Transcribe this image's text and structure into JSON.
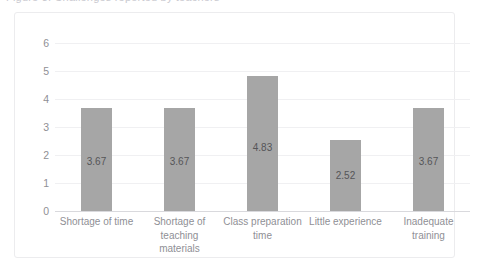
{
  "clipped_title": "Figure 3. Challenges reported by teachers",
  "chart_data": {
    "type": "bar",
    "title": "",
    "xlabel": "",
    "ylabel": "",
    "categories": [
      "Shortage of time",
      "Shortage of teaching materials",
      "Class preparation time",
      "Little experience",
      "Inadequate training"
    ],
    "category_lines": [
      [
        "Shortage of time"
      ],
      [
        "Shortage of",
        "teaching",
        "materials"
      ],
      [
        "Class preparation",
        "time"
      ],
      [
        "Little experience"
      ],
      [
        "Inadequate",
        "training"
      ]
    ],
    "values": [
      3.67,
      3.67,
      4.83,
      2.52,
      3.67
    ],
    "value_labels": [
      "3.67",
      "3.67",
      "4.83",
      "2.52",
      "3.67"
    ],
    "ylim": [
      0,
      6
    ],
    "yticks": [
      6,
      5,
      4,
      3,
      2,
      1,
      0
    ],
    "ytick_labels": [
      "6",
      "5",
      "4",
      "3",
      "2",
      "1",
      "0"
    ],
    "grid": true,
    "legend": false,
    "bar_color": "#a6a6a6",
    "grid_color": "#f0f0f2",
    "axis_color": "#d9d9dd",
    "label_color": "#8f8f95",
    "value_label_color": "#555558"
  }
}
